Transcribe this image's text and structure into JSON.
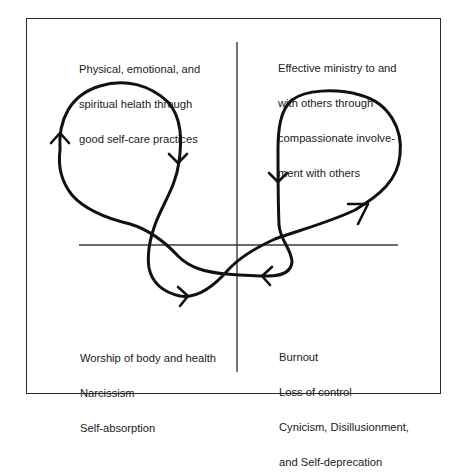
{
  "diagram": {
    "type": "quadrant-cycle",
    "quadrants": {
      "top_left": {
        "lines": [
          "Physical, emotional, and",
          "spiritual helath through",
          "good self-care practices"
        ]
      },
      "top_right": {
        "lines": [
          "Effective ministry to and",
          "with others through",
          "compassionate involve-",
          "ment with others"
        ]
      },
      "bottom_left": {
        "lines": [
          "Worship of body and health",
          "Narcissism",
          "Self-absorption"
        ]
      },
      "bottom_right": {
        "lines": [
          "Burnout",
          "Loss of control",
          "Cynicism, Disillusionment,",
          "and Self-deprecation"
        ]
      }
    },
    "axes": {
      "vertical": {
        "x": 237,
        "y1": 42,
        "y2": 372
      },
      "horizontal": {
        "y": 245,
        "x1": 79,
        "x2": 398
      }
    },
    "colors": {
      "stroke": "#111111",
      "axis": "#3a3a3a",
      "frame": "#2a2a2a",
      "text": "#1a1a1a"
    },
    "arrows": [
      {
        "name": "left-loop-up",
        "direction": "up"
      },
      {
        "name": "left-loop-down",
        "direction": "down"
      },
      {
        "name": "bottom-left-right",
        "direction": "right"
      },
      {
        "name": "right-loop-up-right",
        "direction": "up-right"
      },
      {
        "name": "right-loop-down",
        "direction": "down"
      },
      {
        "name": "bottom-right-left",
        "direction": "left"
      }
    ]
  }
}
